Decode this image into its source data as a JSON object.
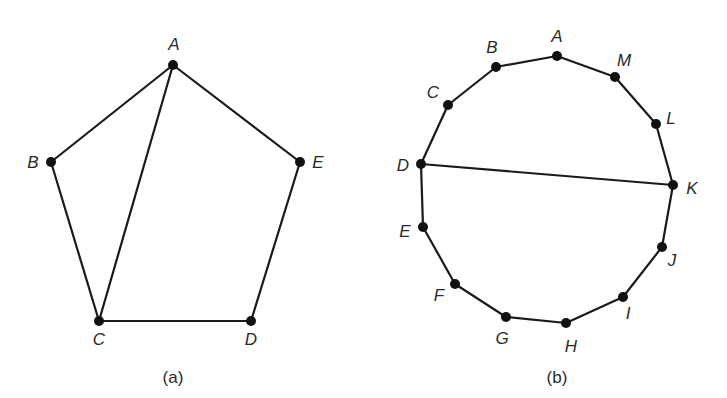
{
  "figures": [
    {
      "id": "a",
      "caption": "(a)",
      "caption_pos": [
        173,
        383
      ],
      "vertices": [
        {
          "label": "A",
          "x": 173,
          "y": 65,
          "lx": 174,
          "ly": 50
        },
        {
          "label": "B",
          "x": 51,
          "y": 162,
          "lx": 33,
          "ly": 168
        },
        {
          "label": "C",
          "x": 99,
          "y": 321,
          "lx": 99,
          "ly": 345
        },
        {
          "label": "D",
          "x": 251,
          "y": 321,
          "lx": 251,
          "ly": 345
        },
        {
          "label": "E",
          "x": 300,
          "y": 162,
          "lx": 318,
          "ly": 168
        }
      ],
      "edges": [
        [
          "A",
          "B"
        ],
        [
          "B",
          "C"
        ],
        [
          "C",
          "D"
        ],
        [
          "D",
          "E"
        ],
        [
          "E",
          "A"
        ],
        [
          "A",
          "C"
        ]
      ]
    },
    {
      "id": "b",
      "caption": "(b)",
      "caption_pos": [
        557,
        383
      ],
      "vertices": [
        {
          "label": "A",
          "x": 557,
          "y": 56,
          "lx": 557,
          "ly": 42
        },
        {
          "label": "B",
          "x": 496,
          "y": 67,
          "lx": 492,
          "ly": 53
        },
        {
          "label": "C",
          "x": 448,
          "y": 105,
          "lx": 433,
          "ly": 98
        },
        {
          "label": "D",
          "x": 421,
          "y": 164,
          "lx": 403,
          "ly": 171
        },
        {
          "label": "E",
          "x": 423,
          "y": 227,
          "lx": 405,
          "ly": 237
        },
        {
          "label": "F",
          "x": 455,
          "y": 284,
          "lx": 439,
          "ly": 301
        },
        {
          "label": "G",
          "x": 506,
          "y": 317,
          "lx": 502,
          "ly": 344
        },
        {
          "label": "H",
          "x": 566,
          "y": 323,
          "lx": 571,
          "ly": 352
        },
        {
          "label": "I",
          "x": 623,
          "y": 297,
          "lx": 628,
          "ly": 319
        },
        {
          "label": "J",
          "x": 662,
          "y": 247,
          "lx": 672,
          "ly": 266
        },
        {
          "label": "K",
          "x": 673,
          "y": 185,
          "lx": 692,
          "ly": 194
        },
        {
          "label": "L",
          "x": 656,
          "y": 124,
          "lx": 671,
          "ly": 124
        },
        {
          "label": "M",
          "x": 615,
          "y": 77,
          "lx": 624,
          "ly": 66
        }
      ],
      "edges": [
        [
          "A",
          "B"
        ],
        [
          "B",
          "C"
        ],
        [
          "C",
          "D"
        ],
        [
          "D",
          "E"
        ],
        [
          "E",
          "F"
        ],
        [
          "F",
          "G"
        ],
        [
          "G",
          "H"
        ],
        [
          "H",
          "I"
        ],
        [
          "I",
          "J"
        ],
        [
          "J",
          "K"
        ],
        [
          "K",
          "L"
        ],
        [
          "L",
          "M"
        ],
        [
          "M",
          "A"
        ],
        [
          "D",
          "K"
        ]
      ]
    }
  ],
  "style": {
    "edge_color": "#1a1a1a",
    "vertex_color": "#111111",
    "label_color": "#2a2a2a",
    "vertex_radius": 5
  }
}
